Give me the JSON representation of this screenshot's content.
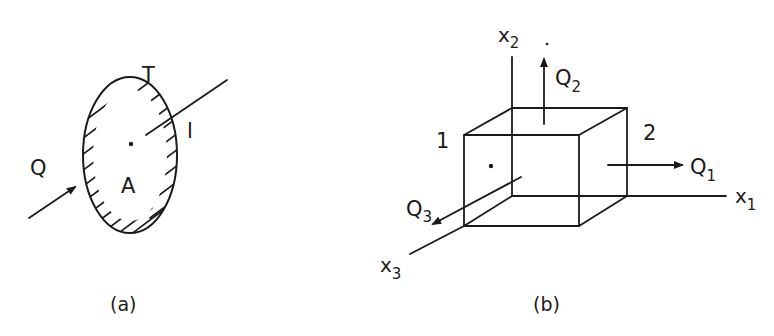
{
  "figure_a": {
    "caption": "(a)",
    "labels": {
      "boundary": "T",
      "line": "l",
      "flux": "Q",
      "area": "A"
    }
  },
  "figure_b": {
    "caption": "(b)",
    "axes": {
      "x1": {
        "base": "x",
        "sub": "1"
      },
      "x2": {
        "base": "x",
        "sub": "2"
      },
      "x3": {
        "base": "x",
        "sub": "3"
      }
    },
    "fluxes": {
      "q1": {
        "base": "Q",
        "sub": "1"
      },
      "q2": {
        "base": "Q",
        "sub": "2"
      },
      "q3": {
        "base": "Q",
        "sub": "3"
      }
    },
    "faces": {
      "face1": "1",
      "face2": "2"
    }
  },
  "colors": {
    "ink": "#1a1a1a",
    "background": "#ffffff"
  }
}
